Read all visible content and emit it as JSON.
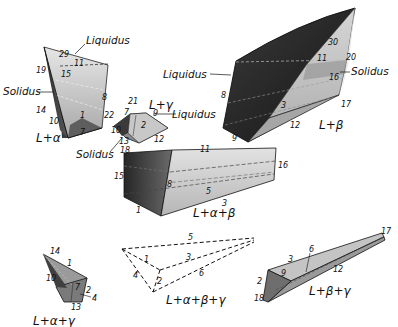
{
  "figure": {
    "pieces": [
      {
        "id": "L+alpha",
        "region_label": "L+α",
        "surface_labels": [
          "Liquidus",
          "Solidus"
        ],
        "vertex_numbers": [
          "29",
          "11",
          "19",
          "15",
          "8",
          "14",
          "10",
          "1",
          "7"
        ]
      },
      {
        "id": "L+gamma",
        "region_label": "L+γ",
        "surface_labels": [
          "Liquidus",
          "Solidus"
        ],
        "vertex_numbers": [
          "21",
          "7",
          "9",
          "22",
          "2",
          "10",
          "13",
          "18",
          "12"
        ]
      },
      {
        "id": "L+beta",
        "region_label": "L+β",
        "surface_labels": [
          "Liquidus",
          "Solidus"
        ],
        "vertex_numbers": [
          "30",
          "11",
          "20",
          "16",
          "8",
          "3",
          "17",
          "12",
          "9"
        ]
      },
      {
        "id": "L+alpha+beta",
        "region_label": "L+α+β",
        "vertex_numbers": [
          "11",
          "16",
          "15",
          "8",
          "5",
          "1",
          "3"
        ]
      },
      {
        "id": "L+alpha+gamma",
        "region_label": "L+α+γ",
        "vertex_numbers": [
          "14",
          "1",
          "10",
          "7",
          "2",
          "4",
          "13"
        ]
      },
      {
        "id": "L+alpha+beta+gamma",
        "region_label": "L+α+β+γ",
        "vertex_numbers": [
          "5",
          "1",
          "3",
          "4",
          "2",
          "6"
        ]
      },
      {
        "id": "L+beta+gamma",
        "region_label": "L+β+γ",
        "vertex_numbers": [
          "17",
          "3",
          "6",
          "9",
          "12",
          "2",
          "18"
        ]
      }
    ]
  },
  "labels": {
    "la_liquidus": "Liquidus",
    "la_solidus": "Solidus",
    "la_region": "L+α",
    "la_29": "29",
    "la_11": "11",
    "la_19": "19",
    "la_15": "15",
    "la_8": "8",
    "la_14": "14",
    "la_10": "10",
    "la_1": "1",
    "la_7": "7",
    "lg_region": "L+γ",
    "lg_liquidus": "Liquidus",
    "lg_solidus": "Solidus",
    "lg_21": "21",
    "lg_7": "7",
    "lg_9": "9",
    "lg_22": "22",
    "lg_2": "2",
    "lg_10": "10",
    "lg_13": "13",
    "lg_18": "18",
    "lg_12": "12",
    "lb_liquidus": "Liquidus",
    "lb_solidus": "Solidus",
    "lb_region": "L+β",
    "lb_30": "30",
    "lb_11": "11",
    "lb_20": "20",
    "lb_16": "16",
    "lb_8": "8",
    "lb_3": "3",
    "lb_17": "17",
    "lb_12": "12",
    "lb_9": "9",
    "lab_region": "L+α+β",
    "lab_11": "11",
    "lab_16": "16",
    "lab_15": "15",
    "lab_8": "8",
    "lab_5": "5",
    "lab_1": "1",
    "lab_3": "3",
    "lag_region": "L+α+γ",
    "lag_14": "14",
    "lag_1": "1",
    "lag_10": "10",
    "lag_7": "7",
    "lag_2": "2",
    "lag_4": "4",
    "lag_13": "13",
    "labg_region": "L+α+β+γ",
    "labg_5": "5",
    "labg_1": "1",
    "labg_3": "3",
    "labg_4": "4",
    "labg_2": "2",
    "labg_6": "6",
    "lbg_region": "L+β+γ",
    "lbg_17": "17",
    "lbg_3": "3",
    "lbg_6": "6",
    "lbg_9": "9",
    "lbg_12": "12",
    "lbg_2": "2",
    "lbg_18": "18"
  }
}
